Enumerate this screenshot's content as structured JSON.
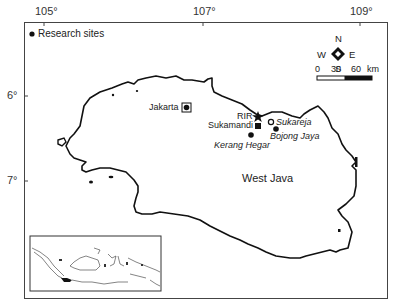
{
  "axes": {
    "longitude_ticks": [
      {
        "label": "105°",
        "x": 44
      },
      {
        "label": "107°",
        "x": 203
      },
      {
        "label": "109°",
        "x": 360
      }
    ],
    "latitude_ticks": [
      {
        "label": "6°",
        "y": 96
      },
      {
        "label": "7°",
        "y": 181
      }
    ]
  },
  "legend": {
    "symbol": "filled-circle",
    "label": "Research sites"
  },
  "compass": {
    "north": "N",
    "south": "S",
    "east": "E",
    "west": "W"
  },
  "scale_bar": {
    "labels": [
      "0",
      "30",
      "60"
    ],
    "unit": "km"
  },
  "region_label": "West Java",
  "places": [
    {
      "name": "Jakarta",
      "symbol": "boxed-circle",
      "style": "normal"
    },
    {
      "name": "RIR",
      "symbol": "star",
      "style": "normal"
    },
    {
      "name": "Sukamandi",
      "symbol": "filled-square",
      "style": "normal"
    },
    {
      "name": "Sukareja",
      "symbol": "open-circle",
      "style": "italic"
    },
    {
      "name": "Bojong Jaya",
      "symbol": "filled-circle",
      "style": "italic"
    },
    {
      "name": "Kerang Hegar",
      "symbol": "filled-circle",
      "style": "italic"
    }
  ],
  "inset": {
    "description": "Indonesia overview map with West Java highlighted"
  },
  "colors": {
    "ink": "#111111",
    "frame": "#444444",
    "background": "#ffffff"
  }
}
